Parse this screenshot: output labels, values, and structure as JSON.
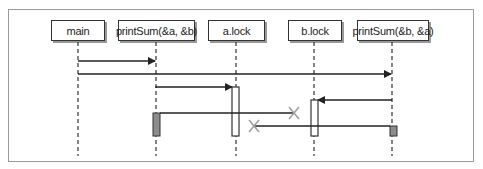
{
  "diagram": {
    "type": "sequence",
    "participants": [
      {
        "id": "main",
        "label": "main"
      },
      {
        "id": "p1",
        "label": "printSum(&a, &b)"
      },
      {
        "id": "alock",
        "label": "a.lock"
      },
      {
        "id": "block",
        "label": "b.lock"
      },
      {
        "id": "p2",
        "label": "printSum(&b, &a)"
      }
    ],
    "messages": [
      {
        "from": "main",
        "to": "p1",
        "kind": "call"
      },
      {
        "from": "main",
        "to": "p2",
        "kind": "call"
      },
      {
        "from": "p1",
        "to": "alock",
        "kind": "call"
      },
      {
        "from": "p2",
        "to": "block",
        "kind": "call"
      },
      {
        "from": "p1",
        "to": "block",
        "kind": "blocked"
      },
      {
        "from": "p2",
        "to": "alock",
        "kind": "blocked"
      }
    ],
    "colors": {
      "line": "#333333",
      "blocked_x": "#a0a0a0",
      "waiting_activation": "#8c8c8c",
      "frame": "#9a9a9a"
    }
  }
}
